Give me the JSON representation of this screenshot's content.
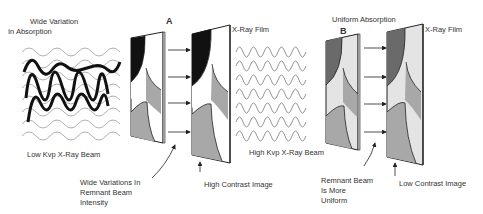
{
  "left_side": {
    "title_line1": "Wide Variation",
    "title_line2": "In Absorption",
    "beam_label": "Low Kvp X-Ray Beam",
    "panel_letter": "A",
    "film_label": "X-Ray Film",
    "remnant_line1": "Wide Variations In",
    "remnant_line2": "Remnant Beam",
    "remnant_line3": "Intensity",
    "image_label": "High Contrast Image"
  },
  "right_side": {
    "title": "Uniform Absorption",
    "beam_label": "High Kvp X-Ray Beam",
    "panel_letter": "B",
    "film_label": "X-Ray Film",
    "remnant_line1": "Remnant Beam",
    "remnant_line2": "Is More",
    "remnant_line3": "Uniform",
    "image_label": "Low Contrast Image"
  },
  "colors": {
    "black": "#111111",
    "dark_gray": "#6a6a6a",
    "mid_gray": "#a8a8a8",
    "light_gray": "#e4e4e4",
    "line": "#222222"
  }
}
